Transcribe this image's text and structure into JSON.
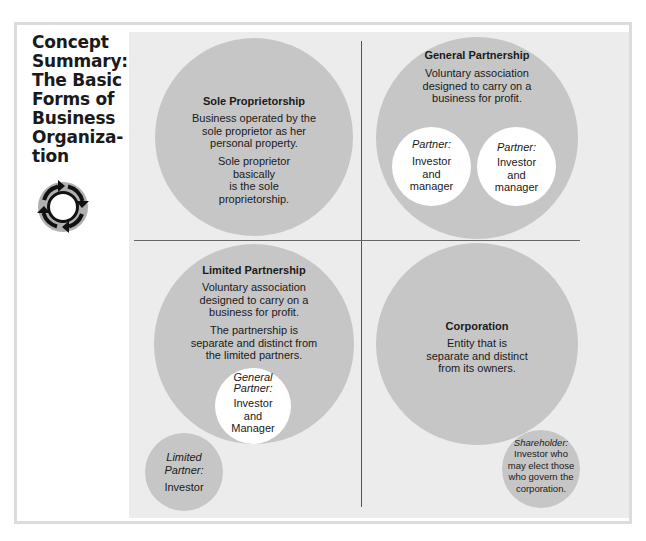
{
  "sidebar": {
    "title_lines": [
      "Concept",
      "Summary:",
      "The Basic",
      "Forms of",
      "Business",
      "Organiza-",
      "tion"
    ],
    "icon": "cycle-arrows-icon"
  },
  "quadrants": {
    "sole_proprietorship": {
      "title": "Sole Proprietorship",
      "desc_lines": [
        "Business operated by the",
        "sole proprietor as her",
        "personal property."
      ],
      "note_lines": [
        "Sole proprietor",
        "basically",
        "is the sole",
        "proprietorship."
      ]
    },
    "general_partnership": {
      "title": "General Partnership",
      "desc_lines": [
        "Voluntary association",
        "designed to carry on a",
        "business for profit."
      ],
      "partners": [
        {
          "label": "Partner:",
          "role_lines": [
            "Investor",
            "and",
            "manager"
          ]
        },
        {
          "label": "Partner:",
          "role_lines": [
            "Investor",
            "and",
            "manager"
          ]
        }
      ]
    },
    "limited_partnership": {
      "title": "Limited Partnership",
      "desc_lines": [
        "Voluntary association",
        "designed to carry on a",
        "business for profit."
      ],
      "note_lines": [
        "The partnership is",
        "separate and distinct from",
        "the limited partners."
      ],
      "general_partner": {
        "label_lines": [
          "General",
          "Partner:"
        ],
        "role_lines": [
          "Investor",
          "and",
          "Manager"
        ]
      },
      "limited_partner": {
        "label_lines": [
          "Limited",
          "Partner:"
        ],
        "role": "Investor"
      }
    },
    "corporation": {
      "title": "Corporation",
      "desc_lines": [
        "Entity that is",
        "separate and distinct",
        "from its owners."
      ],
      "shareholder": {
        "label": "Shareholder:",
        "role_lines": [
          "Investor who",
          "may elect those",
          "who govern the",
          "corporation."
        ]
      }
    }
  },
  "colors": {
    "panel": "#ececec",
    "circle": "#c6c6c6",
    "inner_circle": "#ffffff",
    "divider": "#555555"
  }
}
